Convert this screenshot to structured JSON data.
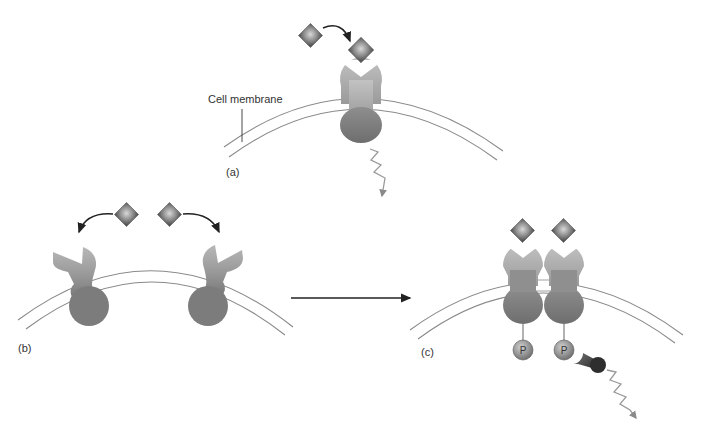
{
  "figure": {
    "labels": {
      "cell_membrane": "Cell membrane",
      "panel_a": "(a)",
      "panel_b": "(b)",
      "panel_c": "(c)",
      "phosphate": "P"
    },
    "panels": [
      {
        "id": "a",
        "description": "Single receptor with bound ligand spanning cell membrane; signal emitted below"
      },
      {
        "id": "b",
        "description": "Two unbound receptor monomers with ligands approaching"
      },
      {
        "id": "c",
        "description": "Ligand-bound receptor dimer, phosphorylated (P), recruiting signaling protein; signal emitted"
      }
    ],
    "colors": {
      "background": "#ffffff",
      "receptor_light": "#b4b4b4",
      "receptor_dark": "#7a7a7a",
      "ligand_light": "#c8c8c8",
      "ligand_dark": "#5a5a5a",
      "membrane_line": "#8a8a8a",
      "arrow": "#222222",
      "signal_wave": "#9a9a9a"
    }
  }
}
